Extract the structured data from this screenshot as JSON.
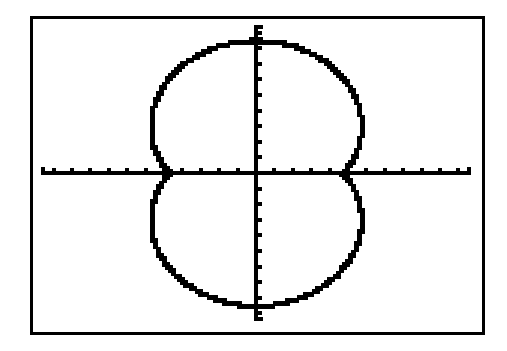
{
  "screen": {
    "frame_color": "#000000",
    "background_color": "#ffffff",
    "pixel_color": "#000000"
  },
  "chart_data": {
    "type": "line",
    "subtype": "polar-graph",
    "title": "",
    "xlabel": "",
    "ylabel": "",
    "description": "Graphing-calculator plot of a peanut-shaped polar curve (symmetric about both axes), approximately r = 4.7 + 3.8|sin(theta)|",
    "grid": false,
    "legend": null,
    "axes": {
      "x_range": [
        -11.7,
        11.7
      ],
      "y_range": [
        -9.5,
        9.5
      ],
      "x_tick_step": 1,
      "y_tick_step": 1,
      "x_ticks_each_side": 11,
      "y_ticks_each_side": 9
    },
    "series": [
      {
        "name": "polar curve",
        "theta_deg": [
          0,
          10,
          20,
          30,
          40,
          50,
          60,
          70,
          80,
          90
        ],
        "r": [
          4.7,
          5.36,
          6.0,
          6.6,
          7.14,
          7.61,
          7.99,
          8.27,
          8.44,
          8.5
        ],
        "points_first_quadrant": [
          [
            4.7,
            0.0
          ],
          [
            5.28,
            0.93
          ],
          [
            5.64,
            2.05
          ],
          [
            5.72,
            3.3
          ],
          [
            5.47,
            4.59
          ],
          [
            4.89,
            5.83
          ],
          [
            4.0,
            6.92
          ],
          [
            2.83,
            7.77
          ],
          [
            1.47,
            8.31
          ],
          [
            0.0,
            8.5
          ]
        ],
        "key_points": {
          "top": [
            0,
            8.5
          ],
          "bottom": [
            0,
            -8.5
          ],
          "x_intercepts": [
            -4.7,
            4.7
          ],
          "max_width_x": 5.72
        }
      }
    ]
  }
}
